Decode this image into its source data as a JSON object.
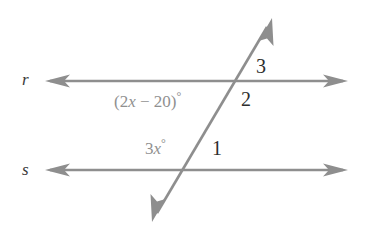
{
  "figure": {
    "type": "geometry-diagram",
    "colors": {
      "line": "#8e8e8e",
      "line_dark": "#7d7d7d",
      "expression_text": "#909090",
      "number_text": "#2e2e2e",
      "line_label_text": "#3a3a3a",
      "background": "#ffffff"
    },
    "lines": [
      {
        "name": "r",
        "label": "r",
        "orientation": "horizontal",
        "y": 81,
        "x_start": 45,
        "x_end": 348,
        "arrows": "both"
      },
      {
        "name": "s",
        "label": "s",
        "orientation": "horizontal",
        "y": 170,
        "x_start": 45,
        "x_end": 348,
        "arrows": "both"
      },
      {
        "name": "transversal",
        "label": "",
        "orientation": "oblique",
        "x_start": 152,
        "y_start": 222,
        "x_end": 272,
        "y_end": 18,
        "arrows": "both"
      }
    ],
    "intersections": [
      {
        "with": "r",
        "x": 238,
        "y": 81
      },
      {
        "with": "s",
        "x": 185,
        "y": 170
      }
    ],
    "angle_labels": [
      {
        "id": "angle-3",
        "text": "3",
        "x": 256,
        "y": 56,
        "style": "number"
      },
      {
        "id": "angle-2",
        "text": "2",
        "x": 241,
        "y": 89,
        "style": "number"
      },
      {
        "id": "angle-1",
        "text": "1",
        "x": 212,
        "y": 138,
        "style": "number"
      }
    ],
    "expressions": [
      {
        "id": "expr-upper",
        "parts": {
          "open": "(2",
          "var": "x",
          "middle": " − 20)",
          "degree": "°"
        },
        "full_text": "(2x − 20)°",
        "x": 114,
        "y": 90
      },
      {
        "id": "expr-lower",
        "parts": {
          "open": "3",
          "var": "x",
          "middle": "",
          "degree": "°"
        },
        "full_text": "3x°",
        "x": 145,
        "y": 137
      }
    ],
    "line_name_labels": [
      {
        "id": "label-r",
        "text": "r",
        "x": 22,
        "y": 71
      },
      {
        "id": "label-s",
        "text": "s",
        "x": 22,
        "y": 161
      }
    ]
  }
}
